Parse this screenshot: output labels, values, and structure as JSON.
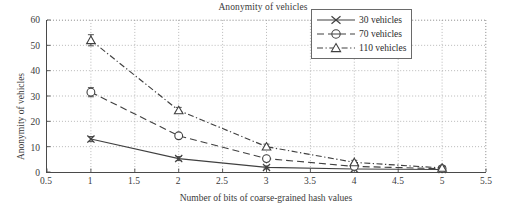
{
  "chart_data": {
    "type": "line",
    "title": "Anonymity of vehicles",
    "xlabel": "Number of bits of coarse-grained hash values",
    "ylabel": "Anonymity of vehicles",
    "xlim": [
      0.5,
      5.5
    ],
    "ylim": [
      0,
      60
    ],
    "xticks": [
      0.5,
      1,
      1.5,
      2,
      2.5,
      3,
      3.5,
      4,
      4.5,
      5,
      5.5
    ],
    "xticklabels": [
      "0.5",
      "1",
      "1.5",
      "2",
      "2.5",
      "3",
      "3.5",
      "4",
      "4.5",
      "5",
      "5.5"
    ],
    "yticks": [
      0,
      10,
      20,
      30,
      40,
      50,
      60
    ],
    "yticklabels": [
      "0",
      "10",
      "20",
      "30",
      "40",
      "50",
      "60"
    ],
    "grid": true,
    "grid_style": "dotted",
    "legend_position": "top-right",
    "error_bars": true,
    "x": [
      1,
      2,
      3,
      4,
      5
    ],
    "series": [
      {
        "name": "30 vehicles",
        "values": [
          13.0,
          5.3,
          1.8,
          1.2,
          1.0
        ],
        "errors": [
          1.0,
          0.8,
          0.6,
          0.4,
          0.3
        ],
        "marker": "x",
        "line_style": "solid",
        "color": "#404040"
      },
      {
        "name": "70 vehicles",
        "values": [
          31.5,
          14.3,
          5.3,
          2.2,
          1.3
        ],
        "errors": [
          1.8,
          1.0,
          0.9,
          0.6,
          0.4
        ],
        "marker": "circle",
        "line_style": "dashed",
        "color": "#404040"
      },
      {
        "name": "110 vehicles",
        "values": [
          52.0,
          24.3,
          10.0,
          3.8,
          1.6
        ],
        "errors": [
          2.2,
          1.2,
          1.0,
          0.8,
          0.5
        ],
        "marker": "triangle",
        "line_style": "dashdot",
        "color": "#404040"
      }
    ]
  },
  "legend": {
    "items": [
      {
        "label": "30 vehicles"
      },
      {
        "label": "70 vehicles"
      },
      {
        "label": "110 vehicles"
      }
    ]
  }
}
